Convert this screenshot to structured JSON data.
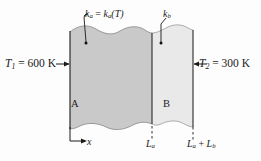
{
  "figure": {
    "background_color": "#fdfdfd"
  },
  "walls": [
    {
      "id": "wall-a",
      "material_label": "A",
      "fill_color": "#c9c9c9",
      "conductivity_label_plain": "k_a = k_a(T)",
      "conductivity_symbol": "k",
      "conductivity_sub": "a",
      "thickness_label": "L_a"
    },
    {
      "id": "wall-b",
      "material_label": "B",
      "fill_color": "#e9e9e9",
      "conductivity_label_plain": "k_b",
      "conductivity_symbol": "k",
      "conductivity_sub": "b",
      "thickness_label": "L_a + L_b"
    }
  ],
  "labels": {
    "temp_left": {
      "symbol": "T",
      "sub": "1",
      "equals": " = ",
      "value": "600",
      "unit": "K",
      "full": "T1 = 600 K"
    },
    "temp_right": {
      "symbol": "T",
      "sub": "2",
      "equals": " = ",
      "value": "300",
      "unit": "K",
      "full": "T2 = 300 K"
    },
    "k_a": {
      "symbol": "k",
      "sub": "a",
      "equals": " = ",
      "func_symbol": "k",
      "func_sub": "a",
      "arg": "(T)"
    },
    "k_b": {
      "symbol": "k",
      "sub": "b"
    },
    "material_a": "A",
    "material_b": "B",
    "axis_x": "x",
    "dim_La": {
      "symbol": "L",
      "sub": "a"
    },
    "dim_LaLb": {
      "symbol1": "L",
      "sub1": "a",
      "plus": " + ",
      "symbol2": "L",
      "sub2": "b"
    }
  },
  "colors": {
    "line": "#1a1a1a",
    "wall_a_fill": "#c9c9c9",
    "wall_b_fill": "#e9e9e9",
    "edge_line": "#555555",
    "background": "#fdfdfd"
  },
  "geometry": {
    "wall_left_x": 70,
    "wall_divider_x": 152,
    "wall_right_x": 193,
    "wall_top_y": 30,
    "wall_bottom_y": 127
  }
}
